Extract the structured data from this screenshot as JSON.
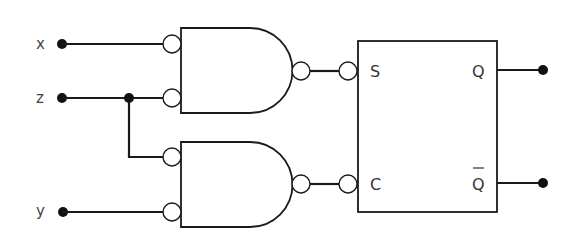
{
  "diagram": {
    "type": "logic-circuit",
    "inputs": [
      {
        "id": "x",
        "label": "x"
      },
      {
        "id": "z",
        "label": "z"
      },
      {
        "id": "y",
        "label": "y"
      }
    ],
    "gates": [
      {
        "id": "gate1",
        "type": "AND",
        "inverted_inputs": true,
        "inverted_output": true,
        "inputs": [
          "x",
          "z"
        ],
        "output_to": "S"
      },
      {
        "id": "gate2",
        "type": "AND",
        "inverted_inputs": true,
        "inverted_output": true,
        "inputs": [
          "z",
          "y"
        ],
        "output_to": "C"
      }
    ],
    "flipflop": {
      "type": "SC latch",
      "input_pins": [
        {
          "label": "S",
          "inverted": true
        },
        {
          "label": "C",
          "inverted": true
        }
      ],
      "output_pins": [
        {
          "label": "Q"
        },
        {
          "label": "Q",
          "overbar": true
        }
      ]
    },
    "colors": {
      "line": "#1a1a1a",
      "fill": "#ffffff",
      "label": "#444444"
    }
  }
}
